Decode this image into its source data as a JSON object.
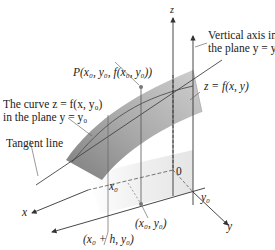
{
  "figure": {
    "labels": {
      "z_axis": "z",
      "x_axis": "x",
      "y_axis": "y",
      "origin": "0",
      "vertical_axis_line1": "Vertical axis in",
      "vertical_axis_line2": "the plane y = y₀",
      "point_P": "P(x₀, y₀, f(x₀, y₀))",
      "surface": "z = f(x, y)",
      "curve_line1": "The curve z = f(x, y₀)",
      "curve_line2": "in the plane y = y₀",
      "tangent_line": "Tangent line",
      "x0": "x₀",
      "y0": "y₀",
      "point_base": "(x₀, y₀)",
      "point_h": "(x₀ + h, y₀)"
    },
    "colors": {
      "surface_dark": "#8c8c8c",
      "surface_mid": "#b4b4b4",
      "surface_light": "#d6d6d6",
      "plane_shade": "#ececec",
      "axis": "#333333",
      "point": "#777777"
    }
  }
}
